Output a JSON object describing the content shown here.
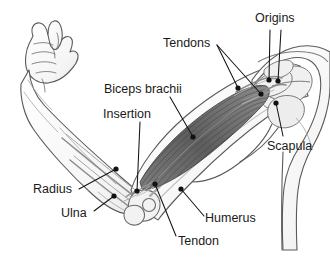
{
  "figure": {
    "type": "anatomy-diagram",
    "background_color": "#ffffff",
    "ink_color": "#1a1a1a",
    "outline_color": "#5a5a5a",
    "muscle_color": "#6b6b6b",
    "bone_color": "#8a8a8a",
    "labels": [
      {
        "id": "origins",
        "text": "Origins",
        "x": 255,
        "y": 12
      },
      {
        "id": "tendons",
        "text": "Tendons",
        "x": 163,
        "y": 37
      },
      {
        "id": "biceps_brachii",
        "text": "Biceps brachii",
        "x": 104,
        "y": 83
      },
      {
        "id": "insertion",
        "text": "Insertion",
        "x": 103,
        "y": 108
      },
      {
        "id": "scapula",
        "text": "Scapula",
        "x": 267,
        "y": 140
      },
      {
        "id": "radius",
        "text": "Radius",
        "x": 33,
        "y": 183
      },
      {
        "id": "ulna",
        "text": "Ulna",
        "x": 61,
        "y": 207
      },
      {
        "id": "humerus",
        "text": "Humerus",
        "x": 205,
        "y": 212
      },
      {
        "id": "tendon",
        "text": "Tendon",
        "x": 178,
        "y": 235
      }
    ],
    "leader_dots": [
      {
        "id": "origin-dot-1",
        "x": 269,
        "y": 80
      },
      {
        "id": "origin-dot-2",
        "x": 278,
        "y": 81
      },
      {
        "id": "tendon-dot-1",
        "x": 238,
        "y": 88
      },
      {
        "id": "tendon-dot-2",
        "x": 261,
        "y": 94
      },
      {
        "id": "scapula-dot",
        "x": 276,
        "y": 103
      },
      {
        "id": "biceps-dot",
        "x": 193,
        "y": 137
      },
      {
        "id": "radius-dot",
        "x": 116,
        "y": 169
      },
      {
        "id": "ulna-dot",
        "x": 114,
        "y": 196
      },
      {
        "id": "tendon-low-dot",
        "x": 155,
        "y": 184
      },
      {
        "id": "insertion-dot",
        "x": 137,
        "y": 191
      },
      {
        "id": "humerus-dot",
        "x": 181,
        "y": 189
      }
    ]
  }
}
